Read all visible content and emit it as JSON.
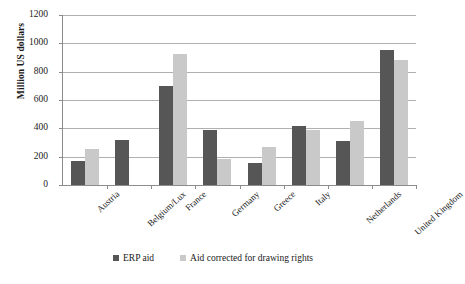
{
  "chart_data": {
    "type": "bar",
    "title": "",
    "subtitle": "",
    "xlabel": "",
    "ylabel": "Million US dollars",
    "ylim": [
      0,
      1200
    ],
    "y_ticks": [
      0,
      200,
      400,
      600,
      800,
      1000,
      1200
    ],
    "grid": true,
    "legend_position": "bottom",
    "categories": [
      "Austria",
      "Belgium/Lux",
      "France",
      "Germany",
      "Greece",
      "Italy",
      "Netherlands",
      "United Kingdom"
    ],
    "series": [
      {
        "name": "ERP aid",
        "color": "#565656",
        "values": [
          170,
          315,
          700,
          385,
          155,
          415,
          310,
          955
        ]
      },
      {
        "name": "Aid corrected for drawing rights",
        "color": "#c9c9c9",
        "values": [
          255,
          null,
          925,
          185,
          270,
          385,
          450,
          885
        ]
      }
    ]
  },
  "legend": {
    "entries": [
      {
        "label": "ERP aid"
      },
      {
        "label": "Aid corrected for drawing rights"
      }
    ]
  },
  "colors": {
    "series_0": "#565656",
    "series_1": "#c9c9c9",
    "gridline": "#b0b0b0",
    "axis": "#8c8c8c",
    "background": "#ffffff"
  }
}
